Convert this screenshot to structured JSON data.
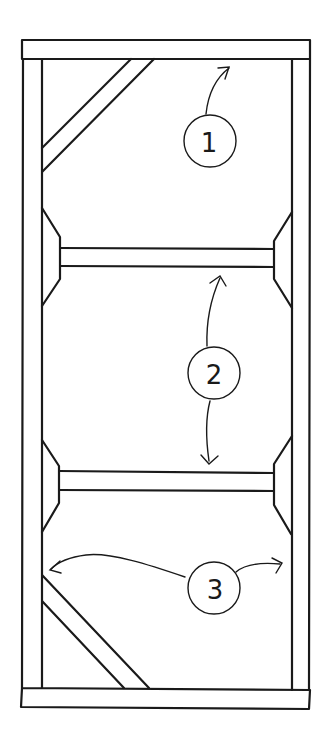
{
  "diagram": {
    "type": "frame-callout-drawing",
    "callouts": [
      {
        "id": "1",
        "label": "1",
        "points_to": "top rail / upper diagonal bay"
      },
      {
        "id": "2",
        "label": "2",
        "points_to": "upper and lower horizontal shelves"
      },
      {
        "id": "3",
        "label": "3",
        "points_to": "left and right side stiles"
      }
    ],
    "colors": {
      "line": "#1a1a1a",
      "background": "#ffffff"
    }
  }
}
